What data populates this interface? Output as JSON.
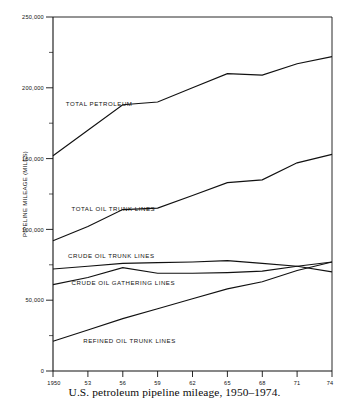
{
  "figure": {
    "caption": "U.S. petroleum pipeline mileage, 1950–1974."
  },
  "chart_data": {
    "type": "line",
    "title": "",
    "subtitle": "",
    "xlabel": "",
    "ylabel": "PIPELINE MILEAGE (MILES)",
    "x": [
      1950,
      1953,
      1956,
      1959,
      1962,
      1965,
      1968,
      1971,
      1974
    ],
    "tick_labels_x": [
      "1950",
      "53",
      "56",
      "59",
      "62",
      "65",
      "68",
      "71",
      "74"
    ],
    "tick_labels_y": [
      "0",
      "50,000",
      "100,000",
      "150,000",
      "200,000",
      "250,000"
    ],
    "ticks_y": [
      0,
      50000,
      100000,
      150000,
      200000,
      250000
    ],
    "minor_ticks_y": [
      25000,
      75000,
      125000,
      175000,
      225000
    ],
    "xlim": [
      1950,
      1974
    ],
    "ylim": [
      0,
      250000
    ],
    "grid": false,
    "legend": "inline-labels",
    "legend_position": "inside-left",
    "line_color": "#111111",
    "series": [
      {
        "name": "TOTAL PETROLEUM",
        "label_x": 1951.1,
        "label_y": 187000,
        "values": [
          152000,
          170000,
          188000,
          190000,
          200000,
          210000,
          209000,
          217000,
          222000
        ]
      },
      {
        "name": "TOTAL OIL TRUNK LINES",
        "label_x": 1951.6,
        "label_y": 113000,
        "values": [
          92000,
          102000,
          114000,
          115000,
          124000,
          133000,
          135000,
          147000,
          153000
        ]
      },
      {
        "name": "CRUDE OIL TRUNK LINES",
        "label_x": 1951.3,
        "label_y": 80000,
        "values": [
          72000,
          74000,
          76000,
          76500,
          77000,
          78000,
          76000,
          74000,
          70000
        ]
      },
      {
        "name": "CRUDE OIL GATHERING LINES",
        "label_x": 1951.6,
        "label_y": 60500,
        "values": [
          61000,
          66000,
          73000,
          69000,
          69000,
          69500,
          70500,
          74000,
          77000
        ]
      },
      {
        "name": "REFINED OIL TRUNK LINES",
        "label_x": 1952.6,
        "label_y": 19500,
        "values": [
          21000,
          29000,
          37000,
          44000,
          51000,
          58000,
          63000,
          71000,
          77000
        ]
      }
    ]
  }
}
